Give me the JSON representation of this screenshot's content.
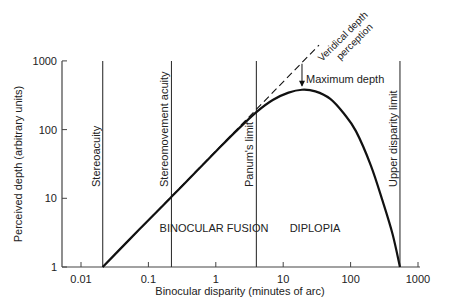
{
  "chart_data": {
    "type": "line",
    "title": "",
    "xlabel": "Binocular disparity (minutes of arc)",
    "ylabel": "Perceived depth (arbitrary units)",
    "xscale": "log",
    "yscale": "log",
    "xlim": [
      0.006,
      1100
    ],
    "ylim": [
      1,
      1000
    ],
    "x_ticks": [
      0.01,
      0.1,
      1,
      10,
      100,
      1000
    ],
    "x_tick_labels": [
      "0.01",
      "0.1",
      "1",
      "10",
      "100",
      "1000"
    ],
    "y_ticks": [
      1,
      10,
      100,
      1000
    ],
    "y_tick_labels": [
      "1",
      "10",
      "100",
      "1000"
    ],
    "grid": false,
    "legend": "none",
    "series": [
      {
        "name": "Perceived depth",
        "style": "solid",
        "x": [
          0.021,
          0.05,
          0.1,
          0.22,
          0.5,
          1,
          2,
          4,
          7,
          12,
          19,
          30,
          50,
          80,
          120,
          200,
          300,
          420,
          540
        ],
        "y": [
          1,
          2.4,
          4.8,
          10.5,
          24,
          48,
          95,
          180,
          270,
          345,
          380,
          360,
          280,
          170,
          95,
          30,
          9,
          3,
          1
        ]
      },
      {
        "name": "Veridical depth perception",
        "style": "dashed",
        "x": [
          0.021,
          34
        ],
        "y": [
          1,
          1700
        ]
      }
    ],
    "vertical_lines": [
      {
        "label": "Stereoacuity",
        "x": 0.021
      },
      {
        "label": "Stereomovement acuity",
        "x": 0.22
      },
      {
        "label": "Panum's limit",
        "x": 4
      },
      {
        "label": "Upper disparity limit",
        "x": 540
      }
    ],
    "annotations": [
      {
        "text": "Veridical depth perception",
        "line1": "Veridical depth",
        "line2": "perception",
        "rotation": -45
      },
      {
        "text": "Maximum depth",
        "x": 19,
        "y": 380,
        "arrow": "down"
      },
      {
        "text": "BINOCULAR FUSION",
        "region": [
          0.22,
          4
        ]
      },
      {
        "text": "DIPLOPIA",
        "region": [
          4,
          540
        ]
      }
    ]
  }
}
